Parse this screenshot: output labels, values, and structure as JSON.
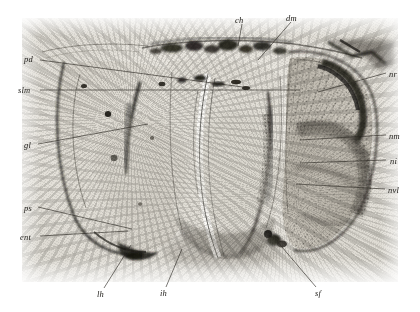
{
  "figure": {
    "kind": "histological-micrograph",
    "plate": {
      "x": 22,
      "y": 18,
      "width": 376,
      "height": 264,
      "background_color": "#e9e7e1",
      "border_color": "#ffffff"
    },
    "page_background": "#ffffff",
    "ink_color": "#2b2823"
  },
  "labels": [
    {
      "id": "ch",
      "text": "ch",
      "side": "top",
      "x": 235,
      "y": 16,
      "leader": [
        [
          242,
          24
        ],
        [
          238,
          46
        ]
      ]
    },
    {
      "id": "dm",
      "text": "dm",
      "side": "top",
      "x": 286,
      "y": 14,
      "leader": [
        [
          291,
          22
        ],
        [
          258,
          60
        ]
      ]
    },
    {
      "id": "pd",
      "text": "pd",
      "side": "left",
      "x": 24,
      "y": 55,
      "leader": [
        [
          40,
          60
        ],
        [
          250,
          88
        ]
      ]
    },
    {
      "id": "slm",
      "text": "slm",
      "side": "left",
      "x": 18,
      "y": 86,
      "leader": [
        [
          40,
          90
        ],
        [
          300,
          90
        ]
      ]
    },
    {
      "id": "gl",
      "text": "gl",
      "side": "left",
      "x": 24,
      "y": 141,
      "leader": [
        [
          38,
          144
        ],
        [
          148,
          124
        ]
      ]
    },
    {
      "id": "ps",
      "text": "ps",
      "side": "left",
      "x": 24,
      "y": 204,
      "leader": [
        [
          38,
          207
        ],
        [
          132,
          229
        ]
      ]
    },
    {
      "id": "ent",
      "text": "ent",
      "side": "left",
      "x": 20,
      "y": 233,
      "leader": [
        [
          40,
          236
        ],
        [
          128,
          231
        ]
      ]
    },
    {
      "id": "nr",
      "text": "nr",
      "side": "right",
      "x": 389,
      "y": 70,
      "leader": [
        [
          386,
          73
        ],
        [
          318,
          92
        ]
      ]
    },
    {
      "id": "nm",
      "text": "nm",
      "side": "right",
      "x": 389,
      "y": 132,
      "leader": [
        [
          386,
          135
        ],
        [
          300,
          140
        ]
      ]
    },
    {
      "id": "ni",
      "text": "ni",
      "side": "right",
      "x": 390,
      "y": 157,
      "leader": [
        [
          386,
          160
        ],
        [
          300,
          163
        ]
      ]
    },
    {
      "id": "nvl",
      "text": "nvl",
      "side": "right",
      "x": 388,
      "y": 186,
      "leader": [
        [
          385,
          189
        ],
        [
          296,
          184
        ]
      ]
    },
    {
      "id": "lh",
      "text": "lh",
      "side": "bottom",
      "x": 97,
      "y": 290,
      "leader": [
        [
          104,
          288
        ],
        [
          131,
          245
        ]
      ]
    },
    {
      "id": "ih",
      "text": "ih",
      "side": "bottom",
      "x": 160,
      "y": 289,
      "leader": [
        [
          166,
          287
        ],
        [
          182,
          249
        ]
      ]
    },
    {
      "id": "sf",
      "text": "sf",
      "side": "bottom",
      "x": 315,
      "y": 289,
      "leader": [
        [
          316,
          287
        ],
        [
          276,
          240
        ]
      ]
    }
  ]
}
